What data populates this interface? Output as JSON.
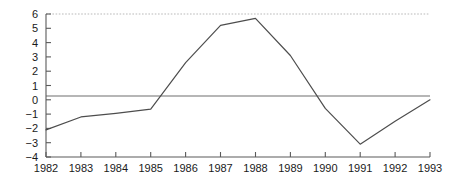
{
  "chart_data": {
    "type": "line",
    "title": "",
    "subtitle": "",
    "xlabel": "",
    "ylabel": "",
    "categories": [
      "1982",
      "1983",
      "1984",
      "1985",
      "1986",
      "1987",
      "1988",
      "1989",
      "1990",
      "1991",
      "1992",
      "1993"
    ],
    "x": [
      1982,
      1983,
      1984,
      1985,
      1986,
      1987,
      1988,
      1989,
      1990,
      1991,
      1992,
      1993
    ],
    "values": [
      -2.1,
      -1.2,
      -0.95,
      -0.65,
      2.6,
      5.2,
      5.7,
      3.1,
      -0.6,
      -3.1,
      -1.5,
      0.0
    ],
    "series": [
      {
        "name": "series-1",
        "values": [
          -2.1,
          -1.2,
          -0.95,
          -0.65,
          2.6,
          5.2,
          5.7,
          3.1,
          -0.6,
          -3.1,
          -1.5,
          0.0
        ]
      }
    ],
    "xlim": [
      1982,
      1993
    ],
    "ylim": [
      -4,
      6
    ],
    "yticks": [
      6,
      5,
      4,
      3,
      2,
      1,
      0,
      -1,
      -2,
      -3,
      -4
    ],
    "ytick_labels": [
      "6",
      "5",
      "4",
      "3",
      "2",
      "1",
      "0",
      "−1",
      "−2",
      "−3",
      "−4"
    ],
    "xticks": [
      1982,
      1983,
      1984,
      1985,
      1986,
      1987,
      1988,
      1989,
      1990,
      1991,
      1992,
      1993
    ],
    "xtick_labels": [
      "1982",
      "1983",
      "1984",
      "1985",
      "1986",
      "1987",
      "1988",
      "1989",
      "1990",
      "1991",
      "1992",
      "1993"
    ],
    "grid": false,
    "legend": "none",
    "annotations": [
      {
        "name": "zero-reference-line",
        "y": 0,
        "style": "solid",
        "color": "#6f6f6f"
      },
      {
        "name": "top-dotted-reference-line",
        "y": 6,
        "style": "dotted",
        "color": "#b9b9b9"
      }
    ],
    "line_color": "#4d4d4d",
    "axis_color": "#5a5a5a",
    "background_color": "#ffffff"
  }
}
